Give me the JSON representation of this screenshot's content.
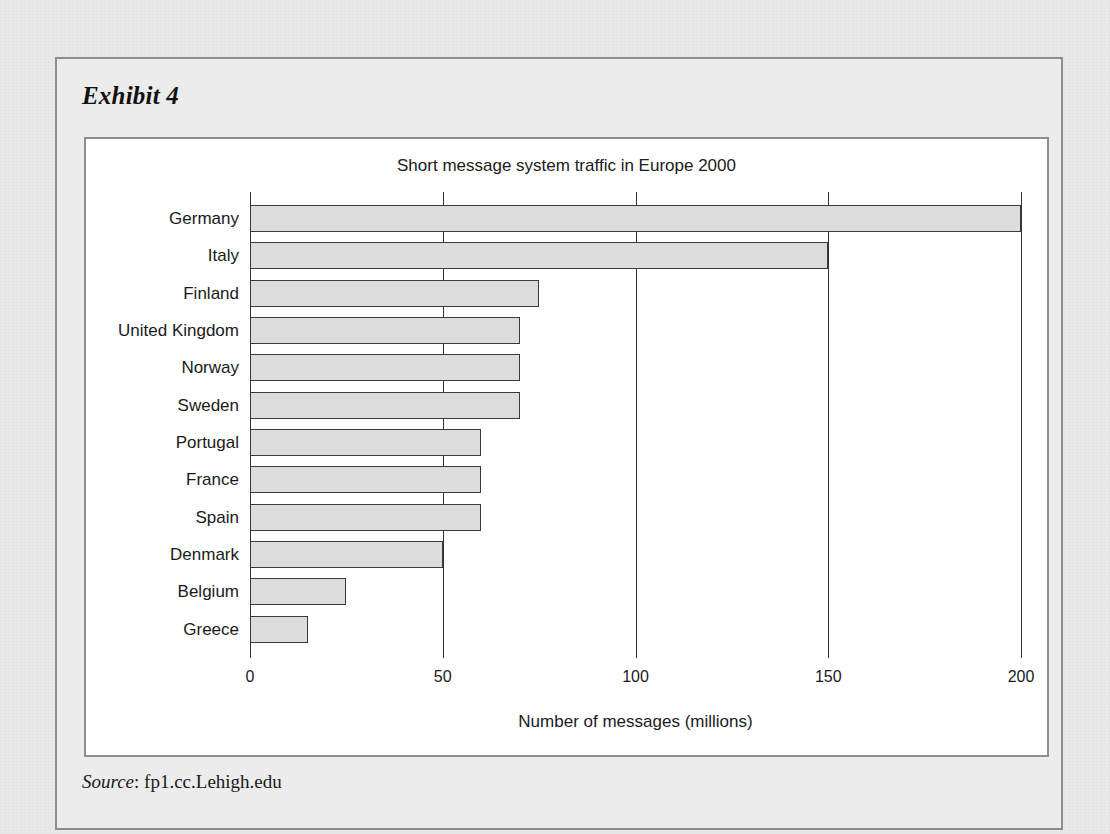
{
  "exhibit": {
    "title": "Exhibit 4",
    "source_label": "Source",
    "source_separator": ": ",
    "source_value": "fp1.cc.Lehigh.edu"
  },
  "colors": {
    "page_background": "#e9e9e9",
    "frame_border": "#8d8d8d",
    "panel_background": "#ffffff",
    "bar_fill": "#dcdcdc",
    "bar_border": "#3a3a3a",
    "gridline": "#333333",
    "text": "#1a1a1a"
  },
  "chart_data": {
    "type": "bar",
    "orientation": "horizontal",
    "title": "Short message system traffic in Europe 2000",
    "xlabel": "Number of messages (millions)",
    "ylabel": "",
    "xlim": [
      0,
      200
    ],
    "xticks": [
      0,
      50,
      100,
      150,
      200
    ],
    "xtick_labels": [
      "0",
      "50",
      "100",
      "150",
      "200"
    ],
    "grid": "vertical",
    "legend": null,
    "categories": [
      "Germany",
      "Italy",
      "Finland",
      "United Kingdom",
      "Norway",
      "Sweden",
      "Portugal",
      "France",
      "Spain",
      "Denmark",
      "Belgium",
      "Greece"
    ],
    "values": [
      200,
      150,
      75,
      70,
      70,
      70,
      60,
      60,
      60,
      50,
      25,
      15
    ]
  }
}
